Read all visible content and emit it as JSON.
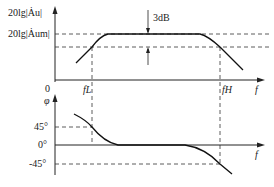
{
  "figure": {
    "magnitude": {
      "y_label": "20lg|Au|",
      "y_level_label": "20lg|Aum|",
      "annotation": "3dB",
      "x_label": "f",
      "origin_label": "0",
      "marks": [
        "fL",
        "fH"
      ]
    },
    "phase": {
      "y_label": "φ",
      "ticks": [
        "45°",
        "0°",
        "-45°"
      ],
      "x_label": "f"
    }
  },
  "labels": {
    "mag_y": "20lg|Ȧu|",
    "mag_level": "20lg|Ȧum|",
    "db3": "3dB",
    "origin": "0",
    "fL": "fL",
    "fH": "fH",
    "f": "f",
    "phi": "φ",
    "t45": "45°",
    "t0": "0°",
    "tm45": "-45°"
  }
}
